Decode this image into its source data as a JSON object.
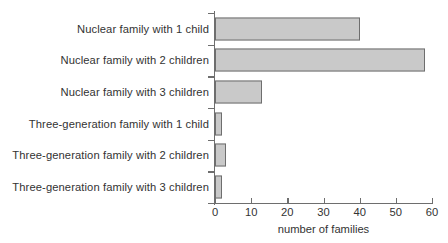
{
  "chart_data": {
    "type": "bar",
    "orientation": "horizontal",
    "title": "",
    "xlabel": "number of families",
    "ylabel": "",
    "xlim": [
      0,
      60
    ],
    "xticks": [
      0,
      10,
      20,
      30,
      40,
      50,
      60
    ],
    "grid": false,
    "legend": null,
    "categories": [
      "Nuclear family with 1 child",
      "Nuclear family with 2 children",
      "Nuclear family with 3 children",
      "Three-generation family with 1 child",
      "Three-generation family with 2 children",
      "Three-generation family with 3 children"
    ],
    "values": [
      40,
      58,
      13,
      2,
      3,
      2
    ],
    "colors": {
      "bar_fill": "#c9c9c9",
      "bar_stroke": "#6e6e6e",
      "axis": "#6e6e6e",
      "text": "#333333",
      "background": "#ffffff"
    }
  }
}
